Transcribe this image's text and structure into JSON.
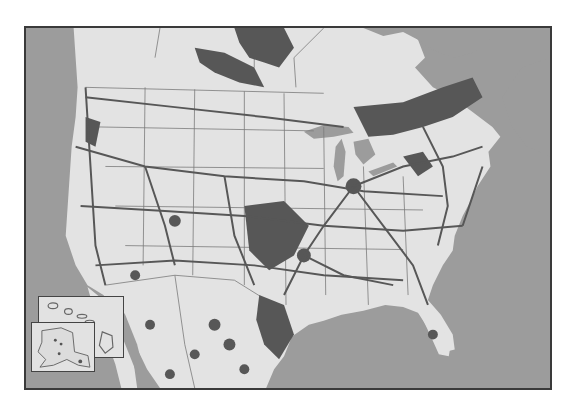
{
  "map": {
    "title": "North America network map",
    "colors": {
      "ocean": "#9c9c9c",
      "land": "#e3e3e3",
      "network": "#575757",
      "borders": "#7a7a7a",
      "frame": "#3a3a3a"
    },
    "insets": [
      {
        "name": "Hawaii",
        "label": ""
      },
      {
        "name": "Alaska",
        "label": ""
      }
    ]
  }
}
